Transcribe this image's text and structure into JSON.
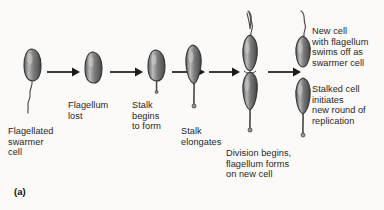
{
  "figure": {
    "panel_label": "(a)",
    "background_color": "#fbfaf8",
    "cell_fill_color": "#8d8d8d",
    "cell_outline_color": "#3a3a3a",
    "arrow_color": "#1a1a1a"
  },
  "labels": {
    "stage1": "Flagellated\nswarmer\ncell",
    "stage2": "Flagellum\nlost",
    "stage3": "Stalk\nbegins\nto form",
    "stage4": "Stalk\nelongates",
    "stage5": "Division begins,\nflagellum forms\non new cell",
    "stage6_top": "New cell\nwith flagellum\nswims off as\nswarmer cell",
    "stage6_bottom": "Stalked cell\ninitiates\nnew round of\nreplication"
  },
  "stages": [
    {
      "name": "flagellated-swarmer-cell",
      "has_flagellum": true,
      "has_stalk": false
    },
    {
      "name": "flagellum-lost-cell",
      "has_flagellum": false,
      "has_stalk": false
    },
    {
      "name": "stalk-forming-cell",
      "has_flagellum": false,
      "has_stalk": true
    },
    {
      "name": "stalk-elongated-cell",
      "has_flagellum": false,
      "has_stalk": true
    },
    {
      "name": "dividing-cell-pair",
      "has_flagellum": true,
      "has_stalk": true
    },
    {
      "name": "separated-cells",
      "has_flagellum": true,
      "has_stalk": true
    }
  ],
  "arrows": {
    "count": 5
  }
}
